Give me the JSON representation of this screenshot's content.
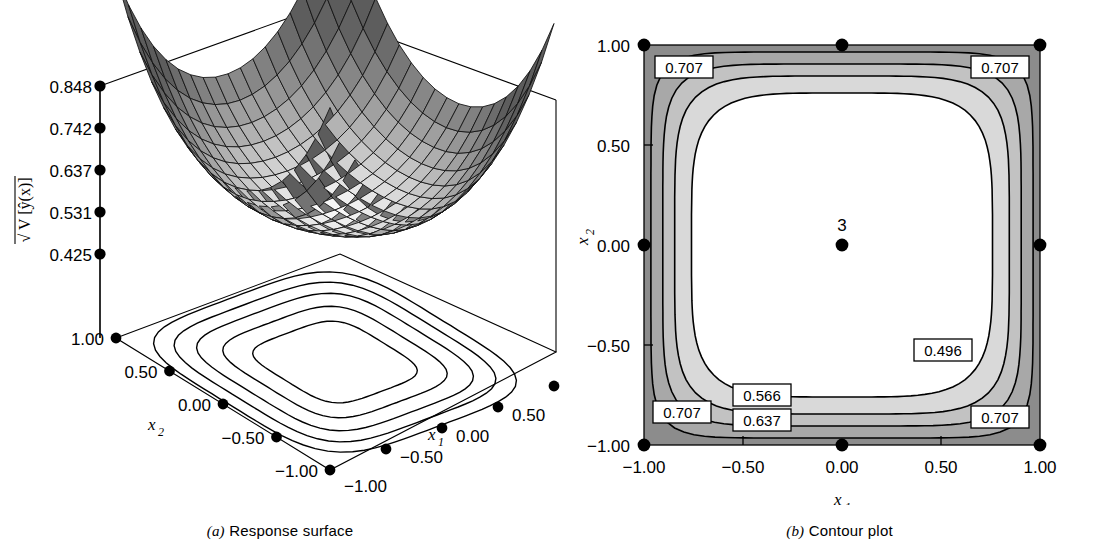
{
  "figure": {
    "panel_a": {
      "caption_tag": "(a)",
      "caption_text": "Response surface"
    },
    "panel_b": {
      "caption_tag": "(b)",
      "caption_text": "Contour plot"
    }
  },
  "surface": {
    "z_axis": {
      "label_root": "√",
      "label_body": "V [ŷ(x)]",
      "ticks": [
        "0.848",
        "0.742",
        "0.637",
        "0.531",
        "0.425"
      ]
    },
    "x2_axis": {
      "name": "x",
      "sub": "2",
      "ticks": [
        "1.00",
        "0.50",
        "0.00",
        "−0.50",
        "−1.00"
      ]
    },
    "x1_axis": {
      "name": "x",
      "sub": "1",
      "ticks": [
        "1.00",
        "0.50",
        "0.00",
        "−0.50",
        "−1.00"
      ]
    },
    "base_contour_rings": 5
  },
  "contour": {
    "x1_axis": {
      "name": "x",
      "sub": "1",
      "ticks": [
        "−1.00",
        "−0.50",
        "0.00",
        "0.50",
        "1.00"
      ]
    },
    "x2_axis": {
      "name": "x",
      "sub": "2",
      "ticks": [
        "1.00",
        "0.50",
        "0.00",
        "−0.50",
        "−1.00"
      ]
    },
    "center_point_label": "3",
    "labels": [
      {
        "id": "tl",
        "text": "0.707"
      },
      {
        "id": "tr",
        "text": "0.707"
      },
      {
        "id": "mid-right",
        "text": "0.496"
      },
      {
        "id": "bl-566",
        "text": "0.566"
      },
      {
        "id": "bl-707",
        "text": "0.707"
      },
      {
        "id": "bl-637",
        "text": "0.637"
      },
      {
        "id": "br",
        "text": "0.707"
      }
    ]
  },
  "chart_data": {
    "type": "contour",
    "xlabel": "x1",
    "ylabel": "x2",
    "zlabel": "sqrt(V[yhat(x)])",
    "xlim": [
      -1.0,
      1.0
    ],
    "ylim": [
      -1.0,
      1.0
    ],
    "xticks": [
      -1.0,
      -0.5,
      0.0,
      0.5,
      1.0
    ],
    "yticks": [
      -1.0,
      -0.5,
      0.0,
      0.5,
      1.0
    ],
    "zticks": [
      0.425,
      0.531,
      0.637,
      0.742,
      0.848
    ],
    "contour_levels": [
      0.496,
      0.566,
      0.637,
      0.707
    ],
    "level_labels": [
      "0.496",
      "0.566",
      "0.637",
      "0.707"
    ],
    "band_fills": [
      "#ffffff",
      "#d9d9d9",
      "#c2c2c2",
      "#a8a8a8",
      "#8c8c8c"
    ],
    "grid": false,
    "legend": "none",
    "design_points": [
      [
        -1.0,
        -1.0
      ],
      [
        0.0,
        -1.0
      ],
      [
        1.0,
        -1.0
      ],
      [
        -1.0,
        0.0
      ],
      [
        0.0,
        0.0
      ],
      [
        1.0,
        0.0
      ],
      [
        -1.0,
        1.0
      ],
      [
        0.0,
        1.0
      ],
      [
        1.0,
        1.0
      ]
    ],
    "center_runs": 3,
    "annotations": [
      {
        "text": "3",
        "x": 0.0,
        "y": 0.0,
        "note": "number of replicate center runs"
      }
    ],
    "surface_note": "Bowl-shaped: prediction variance minimal near the design center and rising toward the corners of the region.",
    "z_min_approx": 0.425,
    "z_max_approx": 0.848
  }
}
